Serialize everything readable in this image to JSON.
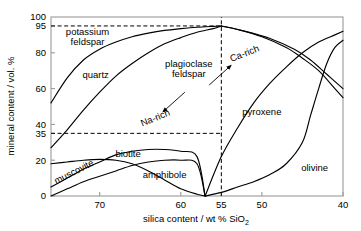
{
  "chart_data": {
    "type": "line",
    "title": "",
    "xlabel": "silica content / wt % SiO2",
    "ylabel": "mineral content / vol. %",
    "xlim": [
      76,
      40
    ],
    "ylim": [
      0,
      100
    ],
    "x_ticks": [
      70,
      60,
      55,
      50,
      40
    ],
    "x_tick_labels": [
      "70",
      "60",
      "55",
      "50",
      "40"
    ],
    "y_ticks": [
      0,
      20,
      35,
      40,
      60,
      80,
      95,
      100
    ],
    "y_tick_labels": [
      "0",
      "20",
      "35",
      "40",
      "60",
      "80",
      "95",
      "100"
    ],
    "grid": false,
    "axis_note": "x-axis is reversed: silica decreases left to right",
    "guide_lines": [
      {
        "name": "y95-dashed",
        "orientation": "horizontal",
        "value": 95,
        "from_x": 76,
        "to_x": 55
      },
      {
        "name": "y35-dashed",
        "orientation": "horizontal",
        "value": 35,
        "from_x": 76,
        "to_x": 55
      },
      {
        "name": "x55-dashed",
        "orientation": "vertical",
        "value": 55,
        "from_y": 0,
        "to_y": 100
      }
    ],
    "series": [
      {
        "name": "potassium feldspar",
        "label": "potassium feldspar",
        "points": [
          [
            76,
            52
          ],
          [
            74,
            66
          ],
          [
            72,
            76
          ],
          [
            70,
            82
          ],
          [
            68,
            86
          ],
          [
            66,
            89
          ],
          [
            64,
            91
          ],
          [
            62,
            92.5
          ],
          [
            60,
            93.5
          ],
          [
            58,
            94.3
          ],
          [
            56,
            94.8
          ],
          [
            55,
            95
          ]
        ]
      },
      {
        "name": "quartz",
        "label": "quartz",
        "points": [
          [
            76,
            27
          ],
          [
            74,
            37
          ],
          [
            72,
            48
          ],
          [
            70,
            58
          ],
          [
            68,
            67
          ],
          [
            66,
            74
          ],
          [
            64,
            80
          ],
          [
            62,
            85
          ],
          [
            60,
            88.5
          ],
          [
            58,
            91.5
          ],
          [
            56,
            93.5
          ],
          [
            55,
            95
          ]
        ]
      },
      {
        "name": "plagioclase feldspar",
        "label": "plagioclase feldspar",
        "points": [
          [
            55,
            95
          ],
          [
            53,
            93
          ],
          [
            50,
            89
          ],
          [
            47,
            83
          ],
          [
            45,
            77
          ],
          [
            43,
            70
          ],
          [
            41,
            60
          ],
          [
            40,
            55
          ]
        ]
      },
      {
        "name": "plagioclase feldspar lower",
        "label": "",
        "points": [
          [
            55,
            95
          ],
          [
            52,
            92
          ],
          [
            49,
            88
          ],
          [
            46,
            82
          ],
          [
            44,
            76
          ],
          [
            42,
            68
          ],
          [
            40,
            60
          ]
        ]
      },
      {
        "name": "muscovite",
        "label": "muscovite",
        "points": [
          [
            76,
            18
          ],
          [
            74,
            19
          ],
          [
            72,
            20
          ],
          [
            70,
            20.5
          ],
          [
            68,
            20
          ],
          [
            66,
            18
          ],
          [
            64,
            14
          ],
          [
            62,
            9
          ],
          [
            60,
            4
          ],
          [
            58,
            1
          ],
          [
            57,
            0
          ]
        ]
      },
      {
        "name": "biotite",
        "label": "biotite",
        "points": [
          [
            76,
            5
          ],
          [
            74,
            10
          ],
          [
            72,
            15
          ],
          [
            70,
            19
          ],
          [
            68,
            23
          ],
          [
            66,
            25
          ],
          [
            64,
            26
          ],
          [
            62,
            26
          ],
          [
            60,
            25
          ],
          [
            58,
            22
          ],
          [
            57,
            0
          ]
        ]
      },
      {
        "name": "amphibole",
        "label": "amphibole",
        "points": [
          [
            76,
            0
          ],
          [
            74,
            4
          ],
          [
            72,
            8
          ],
          [
            70,
            11
          ],
          [
            68,
            14
          ],
          [
            66,
            17
          ],
          [
            64,
            19
          ],
          [
            62,
            20
          ],
          [
            60,
            20
          ],
          [
            58,
            18
          ],
          [
            57,
            0
          ]
        ]
      },
      {
        "name": "pyroxene",
        "label": "pyroxene",
        "points": [
          [
            57,
            0
          ],
          [
            55,
            22
          ],
          [
            53,
            38
          ],
          [
            51,
            52
          ],
          [
            49,
            63
          ],
          [
            47,
            72
          ],
          [
            45,
            80
          ],
          [
            43,
            86
          ],
          [
            41,
            90
          ],
          [
            40,
            92
          ]
        ]
      },
      {
        "name": "olivine",
        "label": "olivine",
        "points": [
          [
            57,
            0
          ],
          [
            55,
            2
          ],
          [
            53,
            5
          ],
          [
            51,
            8
          ],
          [
            49,
            12
          ],
          [
            47,
            18
          ],
          [
            45,
            30
          ],
          [
            44,
            45
          ],
          [
            43,
            60
          ],
          [
            42,
            74
          ],
          [
            41,
            83
          ],
          [
            40,
            87
          ]
        ]
      }
    ],
    "annotations": [
      {
        "name": "potassium-feldspar-label",
        "text": "potassium",
        "text2": "feldspar",
        "x": 71.5,
        "y": 90
      },
      {
        "name": "quartz-label",
        "text": "quartz",
        "x": 70.5,
        "y": 66
      },
      {
        "name": "plagioclase-feldspar-label",
        "text": "plagioclase",
        "text2": "feldspar",
        "x": 59,
        "y": 72
      },
      {
        "name": "na-rich-label",
        "text": "Na-rich",
        "x": 63,
        "y": 42,
        "rotation": -22
      },
      {
        "name": "ca-rich-label",
        "text": "Ca-rich",
        "x": 52,
        "y": 78,
        "rotation": -22
      },
      {
        "name": "muscovite-label",
        "text": "muscovite",
        "x": 73,
        "y": 12,
        "rotation": -27
      },
      {
        "name": "biotite-label",
        "text": "biotite",
        "x": 66.5,
        "y": 22
      },
      {
        "name": "amphibole-label",
        "text": "amphibole",
        "x": 62,
        "y": 10
      },
      {
        "name": "pyroxene-label",
        "text": "pyroxene",
        "x": 50,
        "y": 45
      },
      {
        "name": "olivine-label",
        "text": "olivine",
        "x": 43.5,
        "y": 14
      }
    ],
    "arrows": [
      {
        "name": "na-rich-arrow",
        "from": [
          59.5,
          58
        ],
        "to": [
          62.2,
          47
        ]
      },
      {
        "name": "ca-rich-arrow",
        "from": [
          56.5,
          62
        ],
        "to": [
          53.8,
          73
        ]
      }
    ]
  },
  "axis": {
    "x_title_main": "silica content / wt % SiO",
    "x_title_sub": "2",
    "y_title": "mineral content / vol. %"
  }
}
